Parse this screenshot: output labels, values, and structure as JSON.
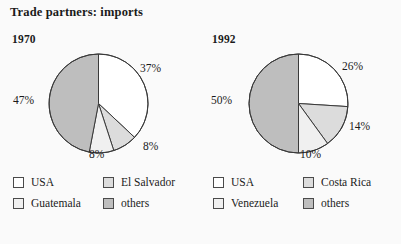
{
  "chart_title": "Trade partners: imports",
  "colors": {
    "usa": "#ffffff",
    "second": "#f0f0f0",
    "third": "#dcdcdc",
    "others": "#bebebe",
    "stroke": "#3a3a3a",
    "background": "#fafafa",
    "text": "#1a1a1a"
  },
  "chart_data": [
    {
      "type": "pie",
      "title": "1970",
      "labels": [
        "USA",
        "El Salvador",
        "Guatemala",
        "others"
      ],
      "values": [
        37,
        8,
        8,
        47
      ],
      "value_labels": [
        "37%",
        "8%",
        "8%",
        "47%"
      ],
      "colors": [
        "#ffffff",
        "#dcdcdc",
        "#f0f0f0",
        "#bebebe"
      ],
      "legend_position": "bottom",
      "start_angle_deg": 0,
      "direction": "clockwise"
    },
    {
      "type": "pie",
      "title": "1992",
      "labels": [
        "USA",
        "Costa Rica",
        "Venezuela",
        "others"
      ],
      "values": [
        26,
        14,
        10,
        50
      ],
      "value_labels": [
        "26%",
        "14%",
        "10%",
        "50%"
      ],
      "colors": [
        "#ffffff",
        "#dcdcdc",
        "#f0f0f0",
        "#bebebe"
      ],
      "legend_position": "bottom",
      "start_angle_deg": 0,
      "direction": "clockwise"
    }
  ],
  "panels": [
    {
      "year": "1970",
      "pct_labels": [
        {
          "text": "37%",
          "left": 140,
          "top": 62
        },
        {
          "text": "8%",
          "left": 143,
          "top": 140
        },
        {
          "text": "8%",
          "left": 89,
          "top": 148
        },
        {
          "text": "47%",
          "left": 13,
          "top": 94
        }
      ],
      "legend": [
        {
          "label": "USA",
          "color": "#ffffff"
        },
        {
          "label": "El Salvador",
          "color": "#dcdcdc"
        },
        {
          "label": "Guatemala",
          "color": "#f0f0f0"
        },
        {
          "label": "others",
          "color": "#bebebe"
        }
      ]
    },
    {
      "year": "1992",
      "pct_labels": [
        {
          "text": "26%",
          "left": 142,
          "top": 60
        },
        {
          "text": "14%",
          "left": 149,
          "top": 120
        },
        {
          "text": "10%",
          "left": 100,
          "top": 148
        },
        {
          "text": "50%",
          "left": 11,
          "top": 94
        }
      ],
      "legend": [
        {
          "label": "USA",
          "color": "#ffffff"
        },
        {
          "label": "Costa Rica",
          "color": "#dcdcdc"
        },
        {
          "label": "Venezuela",
          "color": "#f0f0f0"
        },
        {
          "label": "others",
          "color": "#bebebe"
        }
      ]
    }
  ]
}
